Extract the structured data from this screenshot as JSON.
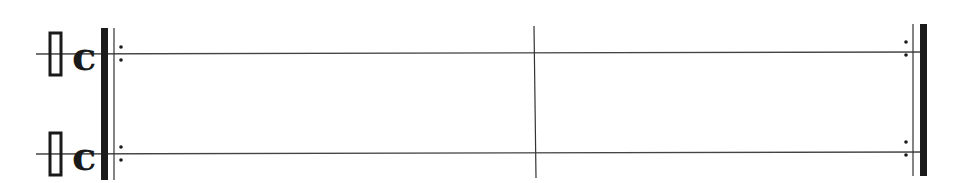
{
  "score": {
    "colors": {
      "ink": "#1a1a1a",
      "line": "#444444",
      "background": "#ffffff"
    },
    "staves": [
      {
        "name": "staff-1",
        "line_y": 54,
        "clef": "percussion-neutral-clef",
        "time_signature": "c",
        "time_signature_meaning": "common time 4/4"
      },
      {
        "name": "staff-2",
        "line_y": 154,
        "clef": "percussion-neutral-clef",
        "time_signature": "c",
        "time_signature_meaning": "common time 4/4"
      }
    ],
    "barlines": [
      {
        "type": "start-repeat",
        "x": 104
      },
      {
        "type": "single",
        "x": 536
      },
      {
        "type": "end-repeat",
        "x": 922
      }
    ],
    "measures": 2
  }
}
